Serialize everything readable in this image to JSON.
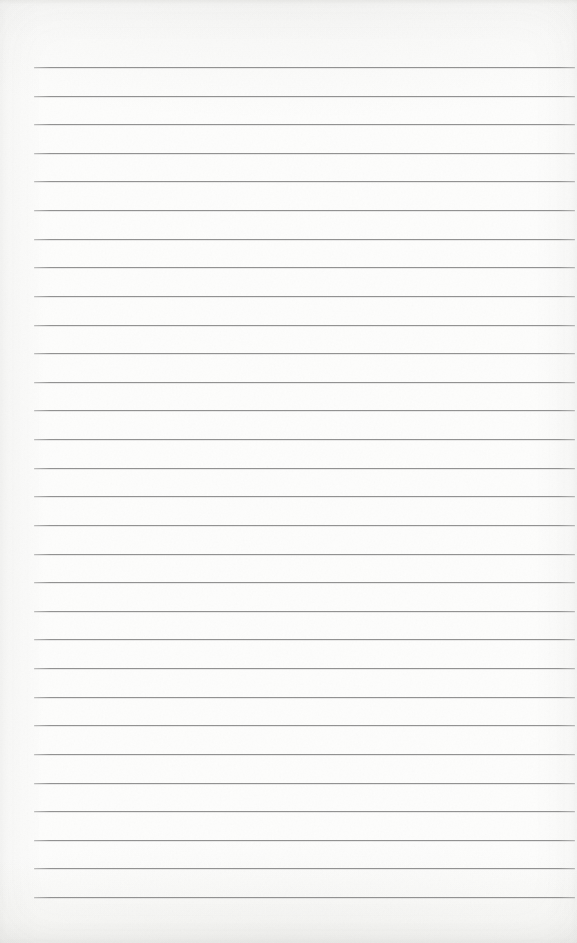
{
  "page": {
    "kind": "blank-ruled-notebook-page",
    "text_content": "",
    "paper_color": "#fdfdfc",
    "rule_color": "#8c8c8c",
    "ruling": {
      "line_count": 30,
      "first_line_top_px": 67,
      "line_spacing_px": 28.62,
      "line_left_px": 34,
      "line_right_px": 575
    }
  }
}
